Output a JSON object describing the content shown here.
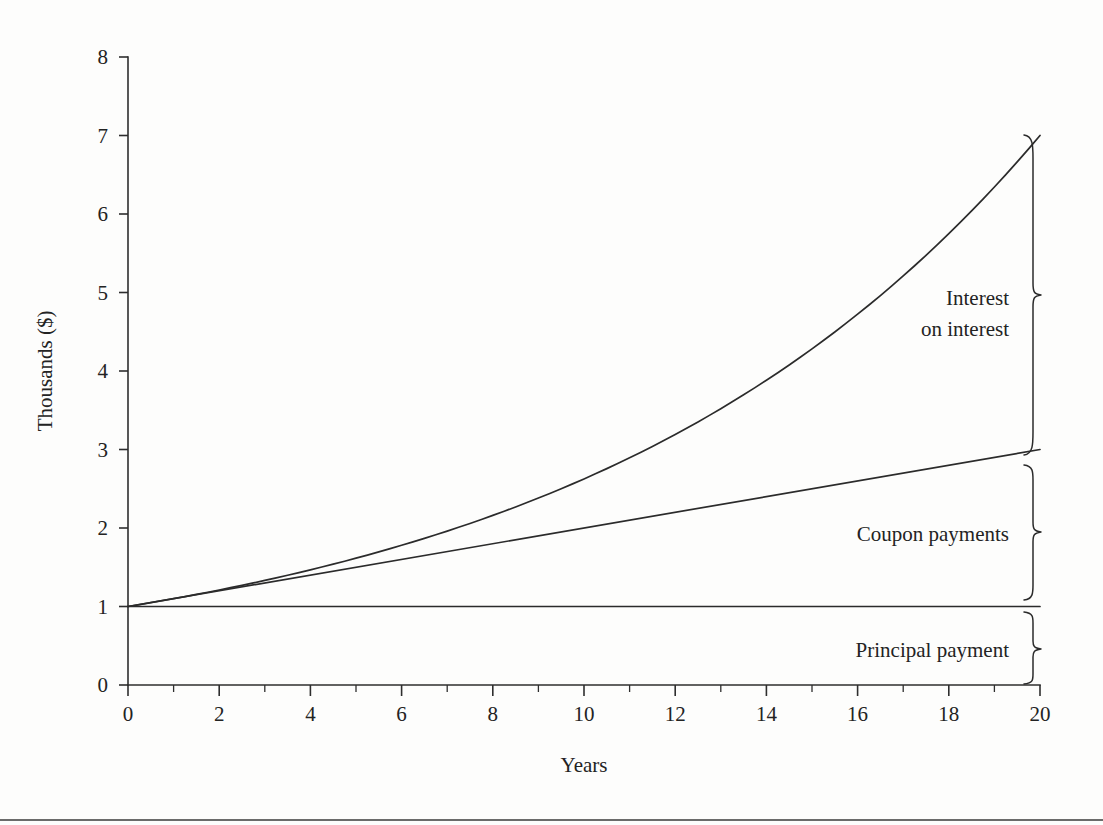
{
  "chart_data": {
    "type": "line",
    "title": "",
    "subtitle": "",
    "xlabel": "Years",
    "ylabel": "Thousands ($)",
    "xlim": [
      0,
      20
    ],
    "ylim": [
      0,
      8
    ],
    "grid": false,
    "legend_position": "none",
    "x_ticks": [
      0,
      2,
      4,
      6,
      8,
      10,
      12,
      14,
      16,
      18,
      20
    ],
    "x_tick_labels": [
      "0",
      "2",
      "4",
      "6",
      "8",
      "10",
      "12",
      "14",
      "16",
      "18",
      "20"
    ],
    "x_minor_ticks": [
      1,
      3,
      5,
      7,
      9,
      11,
      13,
      15,
      17,
      19
    ],
    "y_ticks": [
      0,
      1,
      2,
      3,
      4,
      5,
      6,
      7,
      8
    ],
    "y_tick_labels": [
      "0",
      "1",
      "2",
      "3",
      "4",
      "5",
      "6",
      "7",
      "8"
    ],
    "x": [
      0,
      1,
      2,
      3,
      4,
      5,
      6,
      7,
      8,
      9,
      10,
      11,
      12,
      13,
      14,
      15,
      16,
      17,
      18,
      19,
      20
    ],
    "series": [
      {
        "name": "Total value (principal + coupon payments + interest on interest)",
        "values": [
          1.0,
          1.103,
          1.211,
          1.325,
          1.444,
          1.57,
          1.702,
          1.841,
          1.988,
          2.142,
          2.304,
          2.475,
          2.655,
          2.843,
          3.042,
          3.251,
          3.471,
          3.702,
          3.945,
          4.201,
          4.47
        ]
      },
      {
        "name": "Principal plus coupon payments",
        "values": [
          1.0,
          1.1,
          1.2,
          1.3,
          1.4,
          1.5,
          1.6,
          1.7,
          1.8,
          1.9,
          2.0,
          2.1,
          2.2,
          2.3,
          2.4,
          2.5,
          2.6,
          2.7,
          2.8,
          2.9,
          3.0
        ]
      },
      {
        "name": "Principal payment",
        "values": [
          1.0,
          1.0,
          1.0,
          1.0,
          1.0,
          1.0,
          1.0,
          1.0,
          1.0,
          1.0,
          1.0,
          1.0,
          1.0,
          1.0,
          1.0,
          1.0,
          1.0,
          1.0,
          1.0,
          1.0,
          1.0
        ]
      }
    ],
    "displayed_curves": {
      "note": "Top curve rendered as compound growth reaching 7.0 at year 20; middle line is linear coupon accumulation reaching 3.0 at year 20; bottom line is flat principal at 1.0",
      "top_curve_end_value": 7.0,
      "middle_line_end_value": 3.0,
      "bottom_line_value": 1.0
    },
    "annotations": [
      {
        "id": "interest-on-interest",
        "label_line1": "Interest",
        "label_line2": "on interest",
        "label": "Interest on interest",
        "span_from": 3.0,
        "span_to": 7.0
      },
      {
        "id": "coupon-payments",
        "label_line1": "Coupon payments",
        "label_line2": "",
        "label": "Coupon payments",
        "span_from": 1.0,
        "span_to": 3.0
      },
      {
        "id": "principal-payment",
        "label_line1": "Principal payment",
        "label_line2": "",
        "label": "Principal payment",
        "span_from": 0.0,
        "span_to": 1.0
      }
    ]
  }
}
